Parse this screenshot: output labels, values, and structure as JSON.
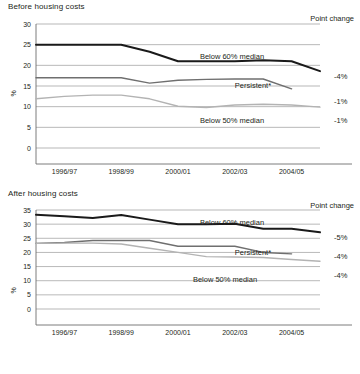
{
  "chart_data": [
    {
      "type": "line",
      "id": "before-housing-costs",
      "title": "Before housing costs",
      "corner_label": "Point change",
      "xlabel": "",
      "ylabel": "%",
      "ylim": [
        0,
        30
      ],
      "yticks": [
        0,
        5,
        10,
        15,
        20,
        25,
        30
      ],
      "grid": true,
      "legend_position": "inline-right",
      "x": [
        "1995/96",
        "1996/97",
        "1997/98",
        "1998/99",
        "1999/00",
        "2000/01",
        "2001/02",
        "2002/03",
        "2003/04",
        "2004/05",
        "2005/06"
      ],
      "xtick_labels": [
        "1996/97",
        "1998/99",
        "2000/01",
        "2002/03",
        "2004/05"
      ],
      "xtick_indices": [
        1,
        3,
        5,
        7,
        9
      ],
      "series": [
        {
          "name": "Below 60% median",
          "label": "Below 60% median",
          "color": "#1a1a1a",
          "width": 2.0,
          "point_change": "-4%",
          "values": [
            25.0,
            25.0,
            25.0,
            25.0,
            23.3,
            21.0,
            21.0,
            21.0,
            21.2,
            21.0,
            18.6
          ]
        },
        {
          "name": "Persistent*",
          "label": "Persistent*",
          "color": "#6f6f6f",
          "width": 1.4,
          "point_change": "-1%",
          "values": [
            17.0,
            17.0,
            17.0,
            17.0,
            15.7,
            16.4,
            16.6,
            16.7,
            16.7,
            14.3,
            null
          ]
        },
        {
          "name": "Below 50% median",
          "label": "Below 50% median",
          "color": "#b3b3b3",
          "width": 1.4,
          "point_change": "-1%",
          "values": [
            11.9,
            12.5,
            12.8,
            12.8,
            11.9,
            10.1,
            9.8,
            10.4,
            10.6,
            10.4,
            9.9
          ]
        }
      ]
    },
    {
      "type": "line",
      "id": "after-housing-costs",
      "title": "After housing costs",
      "corner_label": "Point change",
      "xlabel": "",
      "ylabel": "%",
      "ylim": [
        0,
        35
      ],
      "yticks": [
        0,
        5,
        10,
        15,
        20,
        25,
        30,
        35
      ],
      "grid": true,
      "legend_position": "inline-right",
      "x": [
        "1995/96",
        "1996/97",
        "1997/98",
        "1998/99",
        "1999/00",
        "2000/01",
        "2001/02",
        "2002/03",
        "2003/04",
        "2004/05",
        "2005/06"
      ],
      "xtick_labels": [
        "1996/97",
        "1998/99",
        "2000/01",
        "2002/03",
        "2004/05"
      ],
      "xtick_indices": [
        1,
        3,
        5,
        7,
        9
      ],
      "series": [
        {
          "name": "Below 60% median",
          "label": "Below 60% median",
          "color": "#1a1a1a",
          "width": 2.0,
          "point_change": "-5%",
          "values": [
            33.3,
            32.8,
            32.2,
            33.2,
            31.6,
            30.0,
            30.0,
            30.1,
            28.4,
            28.4,
            27.1
          ]
        },
        {
          "name": "Persistent*",
          "label": "Persistent*",
          "color": "#6f6f6f",
          "width": 1.4,
          "point_change": "-4%",
          "values": [
            23.2,
            23.5,
            24.2,
            24.2,
            24.2,
            22.2,
            22.2,
            22.2,
            20.0,
            19.5,
            null
          ]
        },
        {
          "name": "Below 50% median",
          "label": "Below 50% median",
          "color": "#b3b3b3",
          "width": 1.4,
          "point_change": "-4%",
          "values": [
            23.2,
            23.3,
            23.3,
            23.0,
            21.5,
            20.0,
            18.5,
            18.4,
            18.2,
            17.5,
            16.9
          ]
        }
      ]
    }
  ]
}
